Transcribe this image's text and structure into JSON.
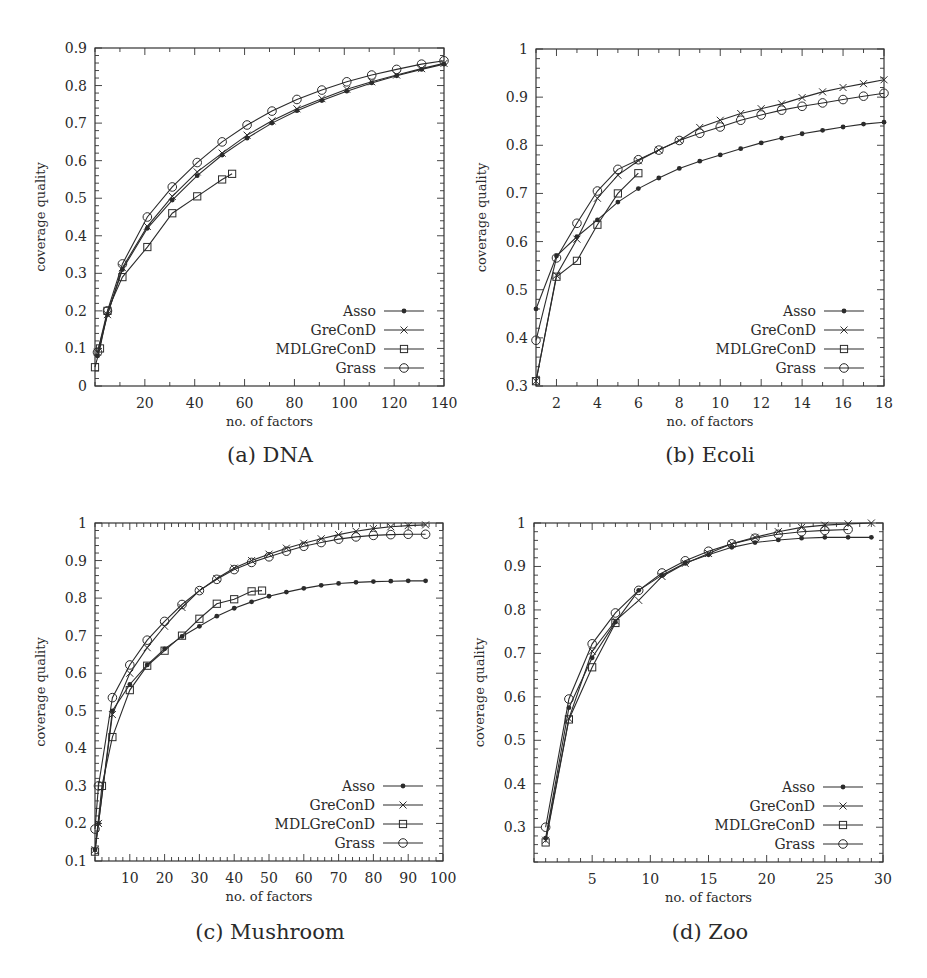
{
  "chart_data": [
    {
      "id": "dna",
      "type": "line",
      "caption": "(a) DNA",
      "xlabel": "no. of factors",
      "ylabel": "coverage quality",
      "xlim": [
        0,
        140
      ],
      "ylim": [
        0,
        0.9
      ],
      "xticks": [
        20,
        40,
        60,
        80,
        100,
        120,
        140
      ],
      "yticks": [
        0,
        0.1,
        0.2,
        0.3,
        0.4,
        0.5,
        0.6,
        0.7,
        0.8,
        0.9
      ],
      "ytick_labels": [
        "0",
        "0.1",
        "0.2",
        "0.3",
        "0.4",
        "0.5",
        "0.6",
        "0.7",
        "0.8",
        "0.9"
      ],
      "xminor": 10,
      "yminor": 0.02,
      "grid": false,
      "legend_position": "lower right",
      "series": [
        {
          "name": "Asso",
          "marker": "dot",
          "x": [
            1,
            5,
            11,
            21,
            31,
            41,
            51,
            61,
            71,
            81,
            91,
            101,
            111,
            121,
            131,
            140
          ],
          "y": [
            0.08,
            0.19,
            0.31,
            0.42,
            0.495,
            0.56,
            0.615,
            0.66,
            0.7,
            0.733,
            0.76,
            0.785,
            0.807,
            0.826,
            0.843,
            0.857
          ]
        },
        {
          "name": "GreConD",
          "marker": "x",
          "x": [
            1,
            5,
            11,
            21,
            31,
            41,
            51,
            61,
            71,
            81,
            91,
            101,
            111,
            121,
            131,
            140
          ],
          "y": [
            0.09,
            0.19,
            0.315,
            0.425,
            0.505,
            0.57,
            0.62,
            0.668,
            0.706,
            0.738,
            0.765,
            0.79,
            0.81,
            0.828,
            0.845,
            0.859
          ]
        },
        {
          "name": "MDLGreConD",
          "marker": "square",
          "x": [
            0,
            2,
            5,
            11,
            21,
            31,
            41,
            51,
            55
          ],
          "y": [
            0.05,
            0.1,
            0.2,
            0.29,
            0.37,
            0.46,
            0.505,
            0.55,
            0.565
          ]
        },
        {
          "name": "Grass",
          "marker": "circle",
          "x": [
            1,
            5,
            11,
            21,
            31,
            41,
            51,
            61,
            71,
            81,
            91,
            101,
            111,
            121,
            131,
            140
          ],
          "y": [
            0.09,
            0.2,
            0.325,
            0.45,
            0.53,
            0.595,
            0.65,
            0.695,
            0.732,
            0.763,
            0.788,
            0.81,
            0.828,
            0.843,
            0.857,
            0.866
          ]
        }
      ]
    },
    {
      "id": "ecoli",
      "type": "line",
      "caption": "(b) Ecoli",
      "xlabel": "no. of factors",
      "ylabel": "coverage quality",
      "xlim": [
        1,
        18
      ],
      "ylim": [
        0.3,
        1
      ],
      "xticks": [
        2,
        4,
        6,
        8,
        10,
        12,
        14,
        16,
        18
      ],
      "yticks": [
        0.3,
        0.4,
        0.5,
        0.6,
        0.7,
        0.8,
        0.9,
        1
      ],
      "ytick_labels": [
        "0.3",
        "0.4",
        "0.5",
        "0.6",
        "0.7",
        "0.8",
        "0.9",
        "1"
      ],
      "xminor": 1,
      "yminor": 0.02,
      "grid": false,
      "legend_position": "lower right",
      "series": [
        {
          "name": "Asso",
          "marker": "dot",
          "x": [
            1,
            2,
            3,
            4,
            5,
            6,
            7,
            8,
            9,
            10,
            11,
            12,
            13,
            14,
            15,
            16,
            17,
            18
          ],
          "y": [
            0.46,
            0.57,
            0.61,
            0.645,
            0.682,
            0.71,
            0.732,
            0.752,
            0.767,
            0.78,
            0.793,
            0.805,
            0.815,
            0.824,
            0.831,
            0.838,
            0.844,
            0.848
          ]
        },
        {
          "name": "GreConD",
          "marker": "x",
          "x": [
            1,
            2,
            3,
            4,
            5,
            6,
            7,
            8,
            9,
            10,
            11,
            12,
            13,
            14,
            15,
            16,
            17,
            18
          ],
          "y": [
            0.31,
            0.53,
            0.605,
            0.69,
            0.738,
            0.768,
            0.79,
            0.81,
            0.837,
            0.852,
            0.866,
            0.876,
            0.886,
            0.899,
            0.911,
            0.92,
            0.928,
            0.936
          ]
        },
        {
          "name": "MDLGreConD",
          "marker": "square",
          "x": [
            1,
            2,
            3,
            4,
            5,
            6
          ],
          "y": [
            0.31,
            0.527,
            0.56,
            0.635,
            0.7,
            0.742
          ]
        },
        {
          "name": "Grass",
          "marker": "circle",
          "x": [
            1,
            2,
            3,
            4,
            5,
            6,
            7,
            8,
            9,
            10,
            11,
            12,
            13,
            14,
            15,
            16,
            17,
            18
          ],
          "y": [
            0.395,
            0.566,
            0.638,
            0.705,
            0.75,
            0.77,
            0.79,
            0.81,
            0.825,
            0.838,
            0.852,
            0.863,
            0.873,
            0.881,
            0.888,
            0.895,
            0.902,
            0.908
          ]
        }
      ]
    },
    {
      "id": "mushroom",
      "type": "line",
      "caption": "(c) Mushroom",
      "xlabel": "no. of factors",
      "ylabel": "coverage quality",
      "xlim": [
        0,
        100
      ],
      "ylim": [
        0.1,
        1
      ],
      "xticks": [
        10,
        20,
        30,
        40,
        50,
        60,
        70,
        80,
        90,
        100
      ],
      "yticks": [
        0.1,
        0.2,
        0.3,
        0.4,
        0.5,
        0.6,
        0.7,
        0.8,
        0.9,
        1
      ],
      "ytick_labels": [
        "0.1",
        "0.2",
        "0.3",
        "0.4",
        "0.5",
        "0.6",
        "0.7",
        "0.8",
        "0.9",
        "1"
      ],
      "xminor": 2,
      "yminor": 0.02,
      "grid": false,
      "legend_position": "lower right",
      "series": [
        {
          "name": "Asso",
          "marker": "dot",
          "x": [
            0,
            1,
            5,
            10,
            15,
            20,
            25,
            30,
            35,
            40,
            45,
            50,
            55,
            60,
            65,
            70,
            75,
            80,
            85,
            90,
            95
          ],
          "y": [
            0.13,
            0.2,
            0.5,
            0.57,
            0.622,
            0.665,
            0.698,
            0.725,
            0.752,
            0.773,
            0.79,
            0.805,
            0.816,
            0.826,
            0.834,
            0.839,
            0.842,
            0.844,
            0.845,
            0.846,
            0.846
          ]
        },
        {
          "name": "GreConD",
          "marker": "x",
          "x": [
            0,
            1,
            5,
            10,
            15,
            20,
            25,
            30,
            35,
            40,
            45,
            50,
            55,
            60,
            65,
            70,
            75,
            80,
            85,
            90,
            95
          ],
          "y": [
            0.13,
            0.2,
            0.49,
            0.6,
            0.668,
            0.725,
            0.775,
            0.82,
            0.852,
            0.88,
            0.9,
            0.917,
            0.933,
            0.946,
            0.958,
            0.969,
            0.978,
            0.985,
            0.99,
            0.993,
            0.995
          ]
        },
        {
          "name": "MDLGreConD",
          "marker": "square",
          "x": [
            0,
            2,
            5,
            10,
            15,
            20,
            25,
            30,
            35,
            40,
            45,
            48
          ],
          "y": [
            0.125,
            0.3,
            0.43,
            0.555,
            0.62,
            0.66,
            0.7,
            0.745,
            0.785,
            0.797,
            0.818,
            0.82
          ]
        },
        {
          "name": "Grass",
          "marker": "circle",
          "x": [
            0,
            1,
            5,
            10,
            15,
            20,
            25,
            30,
            35,
            40,
            45,
            50,
            55,
            60,
            65,
            70,
            75,
            80,
            85,
            90,
            95
          ],
          "y": [
            0.185,
            0.3,
            0.535,
            0.622,
            0.688,
            0.738,
            0.783,
            0.82,
            0.85,
            0.876,
            0.895,
            0.91,
            0.925,
            0.938,
            0.948,
            0.957,
            0.963,
            0.967,
            0.969,
            0.97,
            0.97
          ]
        }
      ]
    },
    {
      "id": "zoo",
      "type": "line",
      "caption": "(d) Zoo",
      "xlabel": "no. of factors",
      "ylabel": "coverage quality",
      "xlim": [
        0,
        30
      ],
      "ylim": [
        0.22,
        1
      ],
      "xticks": [
        5,
        10,
        15,
        20,
        25,
        30
      ],
      "yticks": [
        0.3,
        0.4,
        0.5,
        0.6,
        0.7,
        0.8,
        0.9,
        1
      ],
      "ytick_labels": [
        "0.3",
        "0.4",
        "0.5",
        "0.6",
        "0.7",
        "0.8",
        "0.9",
        "1"
      ],
      "xminor": 1,
      "yminor": 0.02,
      "grid": false,
      "legend_position": "lower right",
      "series": [
        {
          "name": "Asso",
          "marker": "dot",
          "x": [
            1,
            3,
            5,
            7,
            9,
            11,
            13,
            15,
            17,
            19,
            21,
            23,
            25,
            27,
            29
          ],
          "y": [
            0.275,
            0.575,
            0.69,
            0.772,
            0.845,
            0.88,
            0.908,
            0.927,
            0.944,
            0.955,
            0.961,
            0.965,
            0.967,
            0.967,
            0.967
          ]
        },
        {
          "name": "GreConD",
          "marker": "x",
          "x": [
            1,
            3,
            5,
            7,
            9,
            11,
            13,
            15,
            17,
            19,
            21,
            23,
            25,
            27,
            29
          ],
          "y": [
            0.27,
            0.55,
            0.705,
            0.775,
            0.822,
            0.877,
            0.907,
            0.93,
            0.952,
            0.967,
            0.98,
            0.99,
            0.995,
            0.998,
            1.0
          ]
        },
        {
          "name": "MDLGreConD",
          "marker": "square",
          "x": [
            1,
            3,
            5,
            7
          ],
          "y": [
            0.265,
            0.548,
            0.668,
            0.77
          ]
        },
        {
          "name": "Grass",
          "marker": "circle",
          "x": [
            1,
            3,
            5,
            7,
            9,
            11,
            13,
            15,
            17,
            19,
            21,
            23,
            25,
            27
          ],
          "y": [
            0.3,
            0.595,
            0.722,
            0.793,
            0.845,
            0.885,
            0.913,
            0.935,
            0.952,
            0.965,
            0.974,
            0.98,
            0.983,
            0.985
          ]
        }
      ]
    }
  ],
  "panels": [
    {
      "caption": "(a) DNA"
    },
    {
      "caption": "(b) Ecoli"
    },
    {
      "caption": "(c) Mushroom"
    },
    {
      "caption": "(d) Zoo"
    }
  ],
  "layout": [
    {
      "left": 95,
      "top": 48,
      "width": 349,
      "height": 338
    },
    {
      "left": 536,
      "top": 49,
      "width": 348,
      "height": 337
    },
    {
      "left": 95,
      "top": 523,
      "width": 348,
      "height": 338
    },
    {
      "left": 534,
      "top": 523,
      "width": 349,
      "height": 339
    }
  ],
  "colors": {
    "line": "#2b2b2b",
    "axis": "#333333",
    "background": "#ffffff"
  }
}
